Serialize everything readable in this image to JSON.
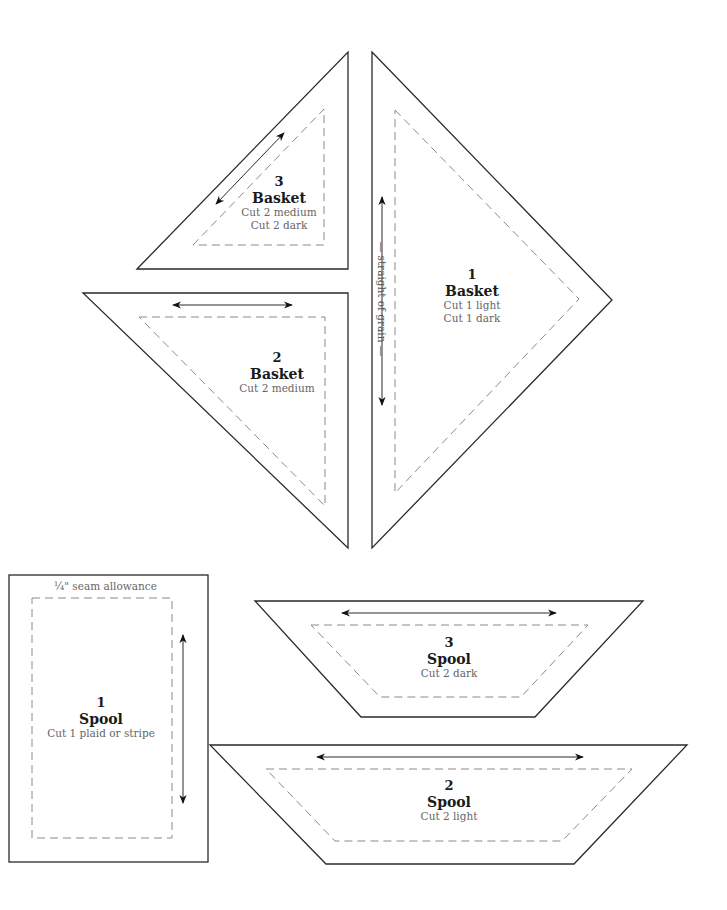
{
  "diagram": {
    "type": "quilt-pattern-templates",
    "colors": {
      "outline": "#2a2a2a",
      "seam_line": "#8a8a8a",
      "label": "#1a1a1a",
      "instruction": "#666666"
    }
  },
  "pieces": [
    {
      "id": "basket-3",
      "number": "3",
      "name": "Basket",
      "instructions": [
        "Cut 2 medium",
        "Cut 2 dark"
      ],
      "shape": "right-triangle"
    },
    {
      "id": "basket-1",
      "number": "1",
      "name": "Basket",
      "instructions": [
        "Cut 1 light",
        "Cut 1 dark"
      ],
      "shape": "right-triangle"
    },
    {
      "id": "basket-2",
      "number": "2",
      "name": "Basket",
      "instructions": [
        "Cut 2 medium"
      ],
      "shape": "right-triangle"
    },
    {
      "id": "spool-1",
      "number": "1",
      "name": "Spool",
      "instructions": [
        "Cut 1 plaid or stripe"
      ],
      "shape": "rectangle"
    },
    {
      "id": "spool-3",
      "number": "3",
      "name": "Spool",
      "instructions": [
        "Cut 2 dark"
      ],
      "shape": "trapezoid"
    },
    {
      "id": "spool-2",
      "number": "2",
      "name": "Spool",
      "instructions": [
        "Cut 2 light"
      ],
      "shape": "trapezoid"
    }
  ],
  "annotations": {
    "seam_allowance": "¼\" seam allowance",
    "grain_label": "straight of grain"
  },
  "icons": {
    "grainline": "double-headed-arrow"
  }
}
